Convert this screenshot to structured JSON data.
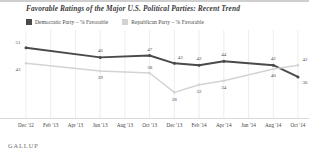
{
  "brand": "GALLUP",
  "legend": {
    "entries": [
      {
        "label": "Democratic Party – % Favorable",
        "color": "#4a4a4a",
        "key": "democratic"
      },
      {
        "label": "Republican Party – % Favorable",
        "color": "#d3d3d3",
        "key": "republican"
      }
    ]
  },
  "chart_data": {
    "type": "line",
    "title": "Favorable Ratings of the Major U.S. Political Parties: Recent Trend",
    "xlabel": "",
    "ylabel": "",
    "ylim": [
      20,
      56
    ],
    "grid": true,
    "legend_position": "top-left",
    "categories": [
      "Dec '12",
      "Feb '13",
      "Apr '13",
      "Jun '13",
      "Aug '13",
      "Oct '13",
      "Dec '13",
      "Feb '14",
      "Apr '14",
      "Jun '14",
      "Aug '14",
      "Oct '14"
    ],
    "tick_labels": [
      "Dec '12",
      "Feb '13",
      "Apr '13",
      "Jun '13",
      "Aug '13",
      "Oct '13",
      "Dec '13",
      "Feb '14",
      "Apr '14",
      "Jun '14",
      "Aug '14",
      "Oct '14"
    ],
    "series": [
      {
        "name": "Democratic Party – % Favorable",
        "color": "#4a4a4a",
        "values": [
          51,
          null,
          null,
          46,
          null,
          47,
          43,
          42,
          44,
          null,
          42,
          36
        ],
        "labels": [
          "51",
          "",
          "",
          "46",
          "",
          "47",
          "43",
          "42",
          "44",
          "",
          "42",
          "36"
        ]
      },
      {
        "name": "Republican Party – % Favorable",
        "color": "#d3d3d3",
        "values": [
          43,
          null,
          null,
          39,
          null,
          38,
          28,
          32,
          34,
          null,
          40,
          42
        ],
        "labels": [
          "43",
          "",
          "",
          "39",
          "",
          "38",
          "28",
          "32",
          "34",
          "",
          "40",
          "42"
        ]
      }
    ]
  }
}
